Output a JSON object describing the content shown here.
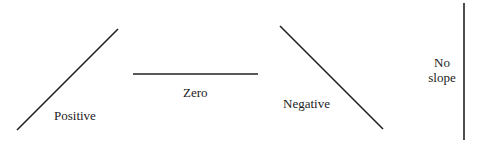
{
  "diagram": {
    "lines": [
      {
        "name": "positive",
        "label": "Positive",
        "x1": 17,
        "y1": 130,
        "x2": 118,
        "y2": 29
      },
      {
        "name": "zero",
        "label": "Zero",
        "x1": 133,
        "y1": 74,
        "x2": 258,
        "y2": 74
      },
      {
        "name": "negative",
        "label": "Negative",
        "x1": 280,
        "y1": 26,
        "x2": 383,
        "y2": 129
      },
      {
        "name": "no-slope",
        "label_line1": "No",
        "label_line2": "slope",
        "x1": 464,
        "y1": 3,
        "x2": 464,
        "y2": 140
      }
    ],
    "stroke_color": "#222222"
  }
}
